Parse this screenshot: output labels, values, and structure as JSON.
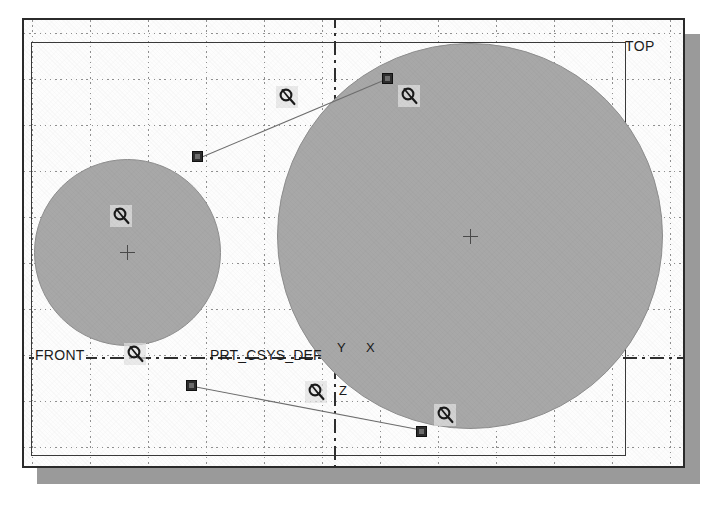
{
  "viewport": {
    "background_color": "#fdfdfd",
    "frame_color": "#2b2b2b",
    "grid_color": "#909090",
    "shadow_color": "#9a9a9a"
  },
  "datums": {
    "top": {
      "label": "TOP",
      "type": "datum-plane",
      "outline_color": "#3a3a3a"
    },
    "front": {
      "label": "FRONT",
      "type": "datum-plane-edge",
      "line_style": "dash-dot",
      "line_color": "#2f2f2f"
    }
  },
  "coordinate_system": {
    "name": "PRT_CSYS_DEF",
    "axes": [
      {
        "label": "Y",
        "direction": "up"
      },
      {
        "label": "X",
        "direction": "right"
      },
      {
        "label": "Z",
        "direction": "down"
      }
    ]
  },
  "geometry": {
    "fill_color": "#a8a8a8",
    "edge_color": "#8e8e8e",
    "features": [
      {
        "name": "large-cylinder-face",
        "shape": "circle",
        "center_x": 470,
        "center_y": 236,
        "diameter": 386
      },
      {
        "name": "small-cylinder-face",
        "shape": "circle",
        "center_x": 127,
        "center_y": 252,
        "diameter": 187
      }
    ]
  },
  "selection": {
    "handle_color": "#2e2e2e",
    "leader_color": "#6f6f6f",
    "handles": [
      {
        "name": "handle-upper-left",
        "x": 197,
        "y": 156
      },
      {
        "name": "handle-upper-right",
        "x": 387,
        "y": 78
      },
      {
        "name": "handle-lower-left",
        "x": 191,
        "y": 385
      },
      {
        "name": "handle-lower-right",
        "x": 421,
        "y": 431
      }
    ],
    "leaders": [
      {
        "name": "leader-upper",
        "x1": 202,
        "y1": 157,
        "x2": 387,
        "y2": 79
      },
      {
        "name": "leader-lower",
        "x1": 196,
        "y1": 387,
        "x2": 421,
        "y2": 430
      }
    ]
  },
  "annotations": {
    "glyph_type": "drag-rotate-handle",
    "glyph_background": "#e2e2e2",
    "glyph_color": "#1a1a1a",
    "items": [
      {
        "name": "drag-glyph-upper-left",
        "x": 276,
        "y": 86
      },
      {
        "name": "drag-glyph-upper-right",
        "x": 398,
        "y": 85
      },
      {
        "name": "drag-glyph-small-circle",
        "x": 110,
        "y": 205
      },
      {
        "name": "drag-glyph-front-left",
        "x": 124,
        "y": 343
      },
      {
        "name": "drag-glyph-csys",
        "x": 305,
        "y": 381
      },
      {
        "name": "drag-glyph-lower-right",
        "x": 434,
        "y": 404
      }
    ]
  },
  "grid": {
    "vertical_spacing": 58,
    "horizontal_spacing": 46,
    "style": "dotted"
  }
}
